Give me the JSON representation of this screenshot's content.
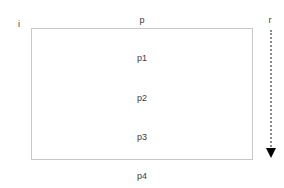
{
  "diagram": {
    "type": "annotated-rectangle-with-direction-arrow",
    "corner_labels": {
      "top_left": "i",
      "top_center": "p",
      "top_right": "r"
    },
    "interior_labels": [
      "p1",
      "p2",
      "p3"
    ],
    "below_box_label": "p4",
    "arrow": {
      "name": "downward-dotted-arrow",
      "direction": "down",
      "line_style": "dotted",
      "line_color": "#8c8c8c",
      "head_color": "#000000"
    },
    "box": {
      "border_color": "#c8c8c8",
      "fill": "transparent"
    },
    "colors": {
      "background": "#ffffff",
      "text": "#3c3c3c"
    }
  }
}
